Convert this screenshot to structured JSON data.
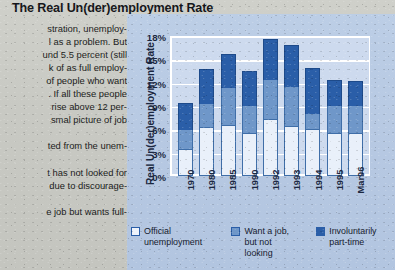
{
  "title": "The Real Un(der)employment Rate",
  "article": {
    "lines": [
      "stration, unemploy-",
      "l as a problem. But",
      "und 5.5 percent (still",
      "k of as full employ-",
      "of people who want",
      ". If all these people",
      " rise above 12 per-",
      "smal picture of job",
      "",
      "ted from the unem-",
      "",
      "t has not looked for",
      " due to discourage-",
      "",
      "e job but wants full-"
    ]
  },
  "chart_data": {
    "type": "bar",
    "subtype": "stacked",
    "title": "The Real Un(der)employment Rate",
    "xlabel": "",
    "ylabel": "Real Un(der)employment Rate",
    "categories": [
      "1970",
      "1980",
      "1985",
      "1990",
      "1992",
      "1993",
      "1994",
      "1995",
      "Mar96"
    ],
    "series": [
      {
        "name": "Official unemployment",
        "color": "#e9f0fa",
        "values": [
          3.5,
          6.3,
          6.5,
          5.5,
          7.3,
          6.4,
          6.0,
          5.5,
          5.5
        ]
      },
      {
        "name": "Want a job, but not looking",
        "color": "#6f97c9",
        "values": [
          2.4,
          3.0,
          4.8,
          3.5,
          5.0,
          5.0,
          2.0,
          3.5,
          3.5
        ]
      },
      {
        "name": "Involuntarily part-time",
        "color": "#2a5ea8",
        "values": [
          3.5,
          4.4,
          4.4,
          4.5,
          5.3,
          5.4,
          5.9,
          3.3,
          3.2
        ]
      }
    ],
    "totals": [
      9.4,
      13.7,
      15.7,
      13.5,
      17.6,
      16.8,
      13.9,
      12.3,
      12.2
    ],
    "ylim": [
      0,
      18
    ],
    "yticks": [
      "0%",
      "3%",
      "6%",
      "9%",
      "12%",
      "15%",
      "18%"
    ],
    "ytick_values": [
      0,
      3,
      6,
      9,
      12,
      15,
      18
    ],
    "grid": true,
    "legend_position": "bottom"
  },
  "legend": [
    {
      "label": "Official\nunemployment",
      "swatch": "sw-official"
    },
    {
      "label": "Want a job,\nbut not\nlooking",
      "swatch": "sw-want"
    },
    {
      "label": "Involuntarily\npart-time",
      "swatch": "sw-part"
    }
  ],
  "colors": {
    "page_background": "#c8c9c3",
    "panel_background": "#b9cbe4",
    "plot_background": "#cddaee",
    "gridline": "#ffffff",
    "series_official": "#e9f0fa",
    "series_want_job": "#6f97c9",
    "series_part_time": "#2a5ea8",
    "text": "#1b2740"
  }
}
